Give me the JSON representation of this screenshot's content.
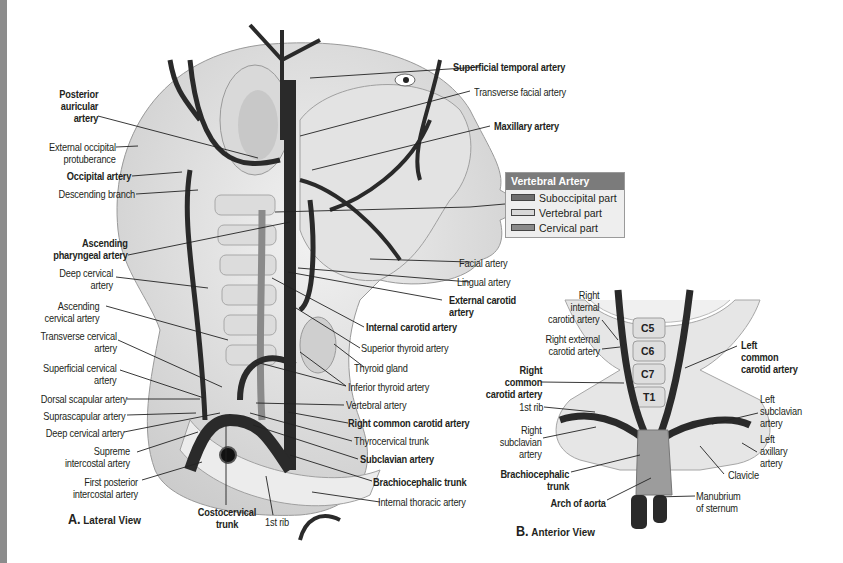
{
  "figure": {
    "panels": [
      {
        "id": "A",
        "letter": "A.",
        "title": "Lateral View"
      },
      {
        "id": "B",
        "letter": "B.",
        "title": "Anterior View"
      }
    ]
  },
  "legend": {
    "title": "Vertebral Artery",
    "items": [
      {
        "label": "Suboccipital part",
        "color": "#6e6e6e"
      },
      {
        "label": "Vertebral part",
        "color": "#d8d8d8"
      },
      {
        "label": "Cervical part",
        "color": "#8a8a8a"
      }
    ]
  },
  "lateral_labels": {
    "posterior_auricular": "Posterior\nauricular\nartery",
    "external_occipital": "External occipital\nprotuberance",
    "occipital": "Occipital artery",
    "descending_branch": "Descending branch",
    "ascending_pharyngeal": "Ascending\npharyngeal artery",
    "deep_cervical_upper": "Deep cervical\nartery",
    "ascending_cervical": "Ascending\ncervical artery",
    "transverse_cervical": "Transverse cervical\nartery",
    "superficial_cervical": "Superficial cervical\nartery",
    "dorsal_scapular": "Dorsal scapular artery",
    "suprascapular": "Suprascapular artery",
    "deep_cervical_lower": "Deep cervical artery",
    "supreme_intercostal": "Supreme\nintercostal artery",
    "first_posterior_intercostal": "First posterior\nintercostal artery",
    "costocervical": "Costocervical\ntrunk",
    "first_rib": "1st rib",
    "superficial_temporal": "Superficial temporal artery",
    "transverse_facial": "Transverse facial artery",
    "maxillary": "Maxillary artery",
    "facial": "Facial artery",
    "lingual": "Lingual artery",
    "external_carotid": "External carotid\nartery",
    "internal_carotid": "Internal carotid artery",
    "superior_thyroid": "Superior thyroid artery",
    "thyroid_gland": "Thyroid gland",
    "inferior_thyroid": "Inferior thyroid artery",
    "vertebral": "Vertebral artery",
    "right_common_carotid": "Right common carotid artery",
    "thyrocervical": "Thyrocervical trunk",
    "subclavian": "Subclavian artery",
    "brachiocephalic": "Brachiocephalic trunk",
    "internal_thoracic": "Internal thoracic artery"
  },
  "anterior_labels": {
    "right_internal_carotid": "Right\ninternal\ncarotid artery",
    "right_external_carotid": "Right external\ncarotid artery",
    "right_common_carotid": "Right\ncommon\ncarotid artery",
    "first_rib": "1st rib",
    "right_subclavian": "Right\nsubclavian\nartery",
    "brachiocephalic": "Brachiocephalic\ntrunk",
    "arch_of_aorta": "Arch of aorta",
    "left_common_carotid": "Left\ncommon\ncarotid artery",
    "left_subclavian": "Left\nsubclavian\nartery",
    "left_axillary": "Left\naxillary\nartery",
    "clavicle": "Clavicle",
    "manubrium": "Manubrium\nof sternum"
  },
  "vertebrae": [
    "C5",
    "C6",
    "C7",
    "T1"
  ]
}
